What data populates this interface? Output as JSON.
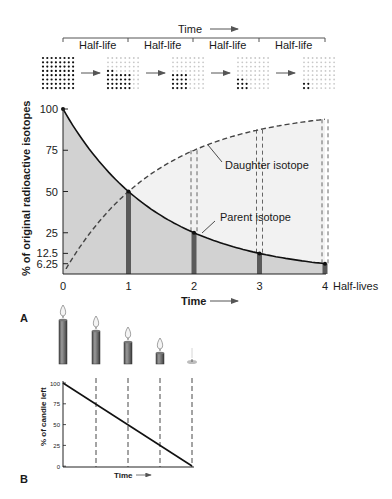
{
  "panel_a": {
    "label": "A",
    "time_label": "Time",
    "half_life_label": "Half-life",
    "half_life_segments": [
      "Half-life",
      "Half-life",
      "Half-life",
      "Half-life"
    ],
    "dot_grids": [
      {
        "stage": 0,
        "parent_dots": 64,
        "total_dots": 64
      },
      {
        "stage": 1,
        "parent_dots": 32,
        "total_dots": 64
      },
      {
        "stage": 2,
        "parent_dots": 16,
        "total_dots": 64
      },
      {
        "stage": 3,
        "parent_dots": 8,
        "total_dots": 64
      },
      {
        "stage": 4,
        "parent_dots": 4,
        "total_dots": 64
      }
    ],
    "daughter_label": "Daughter isotope",
    "parent_label": "Parent isotope",
    "xaxis_label": "Time",
    "xaxis_unit": "Half-lives",
    "yaxis_label": "% of original radioactive isotopes"
  },
  "panel_b": {
    "label": "B",
    "yaxis_label": "% of candle left",
    "xaxis_label": "Time",
    "candles": [
      100,
      75,
      50,
      25,
      0
    ]
  },
  "chart_data": [
    {
      "type": "line",
      "title": "",
      "xlabel": "Time (Half-lives)",
      "ylabel": "% of original radioactive isotopes",
      "x": [
        0,
        1,
        2,
        3,
        4
      ],
      "x_ticks": [
        "0",
        "1",
        "2",
        "3",
        "4"
      ],
      "y_ticks": [
        "100",
        "75",
        "50",
        "25",
        "12.5",
        "6.25"
      ],
      "ylim": [
        0,
        100
      ],
      "series": [
        {
          "name": "Parent isotope",
          "style": "solid",
          "values": [
            100,
            50,
            25,
            12.5,
            6.25
          ]
        },
        {
          "name": "Daughter isotope",
          "style": "dashed",
          "values": [
            0,
            50,
            75,
            87.5,
            93.75
          ]
        }
      ]
    },
    {
      "type": "line",
      "title": "",
      "xlabel": "Time",
      "ylabel": "% of candle left",
      "x": [
        0,
        1,
        2,
        3,
        4
      ],
      "y_ticks": [
        "100",
        "75",
        "50",
        "25",
        "0"
      ],
      "ylim": [
        0,
        100
      ],
      "series": [
        {
          "name": "Candle",
          "style": "solid",
          "values": [
            100,
            75,
            50,
            25,
            0
          ]
        }
      ]
    }
  ]
}
